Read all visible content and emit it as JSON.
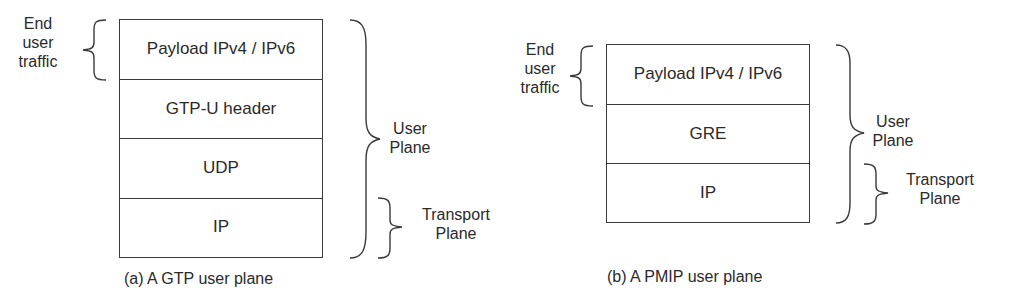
{
  "diagrams": [
    {
      "id": "gtp",
      "caption": "(a) A GTP user plane",
      "layers": [
        "Payload IPv4 / IPv6",
        "GTP-U header",
        "UDP",
        "IP"
      ],
      "annotations": {
        "end_user_traffic": [
          "End",
          "user",
          "traffic"
        ],
        "user_plane": [
          "User",
          "Plane"
        ],
        "transport_plane": [
          "Transport",
          "Plane"
        ]
      }
    },
    {
      "id": "pmip",
      "caption": "(b) A PMIP user plane",
      "layers": [
        "Payload IPv4 / IPv6",
        "GRE",
        "IP"
      ],
      "annotations": {
        "end_user_traffic": [
          "End",
          "user",
          "traffic"
        ],
        "user_plane": [
          "User",
          "Plane"
        ],
        "transport_plane": [
          "Transport",
          "Plane"
        ]
      }
    }
  ]
}
